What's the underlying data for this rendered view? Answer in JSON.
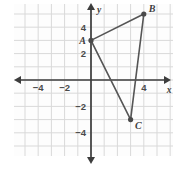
{
  "chart_data": {
    "type": "scatter",
    "title": "",
    "xlabel": "x",
    "ylabel": "y",
    "xlim": [
      -6,
      6
    ],
    "ylim": [
      -6,
      6
    ],
    "grid": true,
    "grid_step": 1,
    "legend": "none",
    "xticks": [
      -4,
      -2,
      4
    ],
    "xtick_labels": [
      "−4",
      "−2",
      "4"
    ],
    "yticks": [
      4,
      2,
      -2,
      -4
    ],
    "ytick_labels": [
      "4",
      "2",
      "−2",
      "−4"
    ],
    "points": [
      {
        "name": "A",
        "x": 0,
        "y": 3,
        "label": "A",
        "label_pos": "left"
      },
      {
        "name": "B",
        "x": 4,
        "y": 5,
        "label": "B",
        "label_pos": "right"
      },
      {
        "name": "C",
        "x": 3,
        "y": -3,
        "label": "C",
        "label_pos": "right"
      }
    ],
    "shape": {
      "type": "triangle",
      "vertices": [
        "A",
        "B",
        "C"
      ],
      "closed": true,
      "filled": false
    },
    "annotations": []
  },
  "style": {
    "grid_color": "#d9d9d9",
    "axis_color": "#3d3d3d",
    "shape_color": "#555555",
    "point_color": "#4a4a4a",
    "background": "#ffffff",
    "plot_background": "#fdfdfd"
  }
}
